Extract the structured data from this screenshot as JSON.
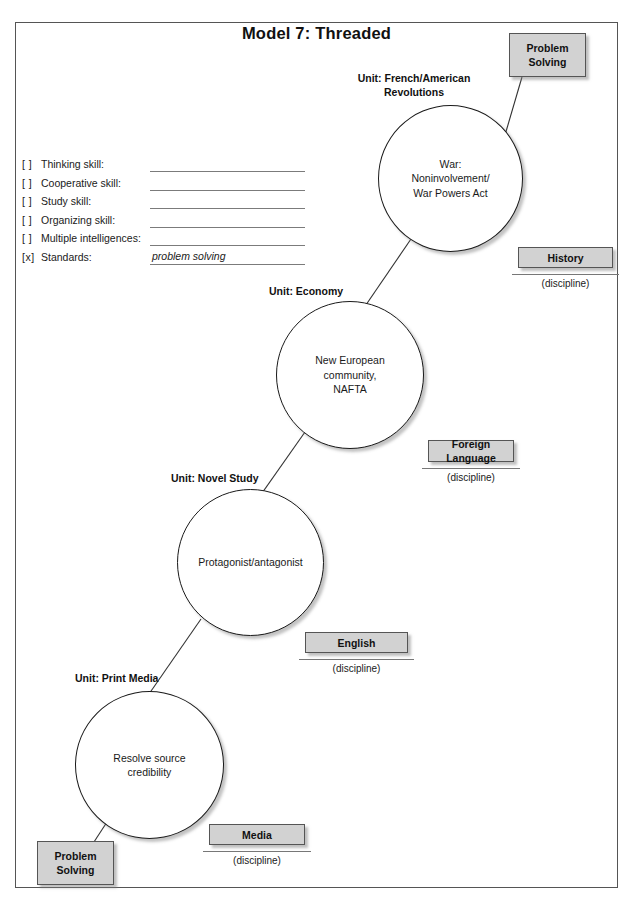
{
  "title": "Model 7: Threaded",
  "checklist": {
    "items": [
      {
        "mark": "[ ]",
        "label": "Thinking skill:",
        "value": ""
      },
      {
        "mark": "[ ]",
        "label": "Cooperative skill:",
        "value": ""
      },
      {
        "mark": "[ ]",
        "label": "Study skill:",
        "value": ""
      },
      {
        "mark": "[ ]",
        "label": "Organizing skill:",
        "value": ""
      },
      {
        "mark": "[ ]",
        "label": "Multiple intelligences:",
        "value": ""
      },
      {
        "mark": "[x]",
        "label": "Standards:",
        "value": "problem solving"
      }
    ]
  },
  "nodes": [
    {
      "unit": "Unit: French/American\nRevolutions",
      "content": "War:\nNoninvolvement/\nWar Powers Act"
    },
    {
      "unit": "Unit: Economy",
      "content": "New European\ncommunity,\nNAFTA"
    },
    {
      "unit": "Unit: Novel Study",
      "content": "Protagonist/antagonist"
    },
    {
      "unit": "Unit: Print Media",
      "content": "Resolve source\ncredibility"
    }
  ],
  "tags": [
    {
      "label": "Problem\nSolving"
    },
    {
      "label": "History"
    },
    {
      "label": "Foreign Language"
    },
    {
      "label": "English"
    },
    {
      "label": "Media"
    },
    {
      "label": "Problem\nSolving"
    }
  ],
  "discipline_caption": "(discipline)",
  "colors": {
    "tag_fill": "#d2d2d2",
    "border": "#555555",
    "text": "#1a1a1a"
  }
}
